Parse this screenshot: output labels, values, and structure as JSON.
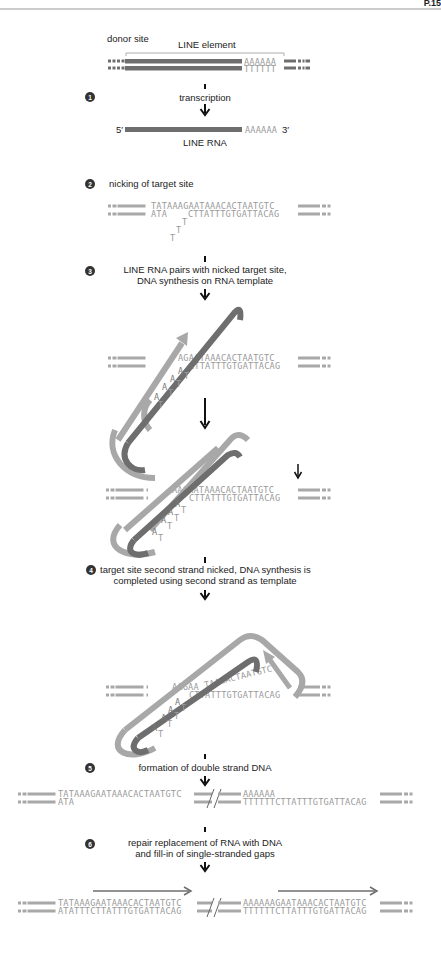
{
  "header": {
    "page_label": "P.15"
  },
  "colors": {
    "dark_strand": "#6e6e6e",
    "light_strand": "#a8a8a8",
    "sequence_text": "#9a9a9a",
    "label_text": "#222222",
    "step_circle": "#333333"
  },
  "top": {
    "donor_site": "donor site",
    "line_element": "LINE element",
    "polyA": "AAAAAA",
    "polyT": "TTTTTT"
  },
  "steps": [
    {
      "number": "1",
      "label": "transcription",
      "rna_5prime": "5′",
      "rna_polyA": "AAAAAA",
      "rna_3prime": "3′",
      "rna_label": "LINE RNA"
    },
    {
      "number": "2",
      "label": "nicking of target site",
      "top_seq": "TATAAAGAATAAACACTAATGTC",
      "bottom_seq_left": "ATA",
      "bottom_seq_right": "CTTATTTGTGATTACAG",
      "flap": [
        "T",
        "T",
        "T"
      ]
    },
    {
      "number": "3",
      "label_line1": "LINE RNA pairs with nicked target site,",
      "label_line2": "DNA synthesis on RNA template",
      "top_seq": "AGAATAAACACTAATGTC",
      "bottom_seq": "CTTATTTGTGATTACAG",
      "pairs_A": [
        "A",
        "A",
        "A",
        "A"
      ],
      "pairs_T": [
        "T",
        "T",
        "T",
        "T"
      ]
    },
    {
      "number": "",
      "top_seq": "AAGAATAAACACTAATGTC",
      "bottom_seq": "CTTATTTGTGATTACAG"
    },
    {
      "number": "4",
      "label_line1": "target site second strand nicked, DNA synthesis is",
      "label_line2": "completed using second strand as template",
      "top_seq_flat": "AAGAA",
      "top_seq_raised": "TAACACTAATGTC",
      "bottom_seq": "CTTATTTGTGATTACAG"
    },
    {
      "number": "5",
      "label": "formation of double strand DNA",
      "left_top": "TATAAAGAATAAACACTAATGTC",
      "left_bottom": "ATA",
      "right_top": "AAAAAA",
      "right_bottom": "TTTTTTCTTATTTGTGATTACAG"
    },
    {
      "number": "6",
      "label_line1": "repair replacement of RNA with DNA",
      "label_line2": "and fill-in of single-stranded gaps",
      "left_top": "TATAAAGAATAAACACTAATGTC",
      "left_bottom": "ATATTTCTTATTTGTGATTACAG",
      "right_top": "AAAAAAGAATAAACACTAATGTC",
      "right_bottom": "TTTTTTCTTATTTGTGATTACAG"
    }
  ]
}
